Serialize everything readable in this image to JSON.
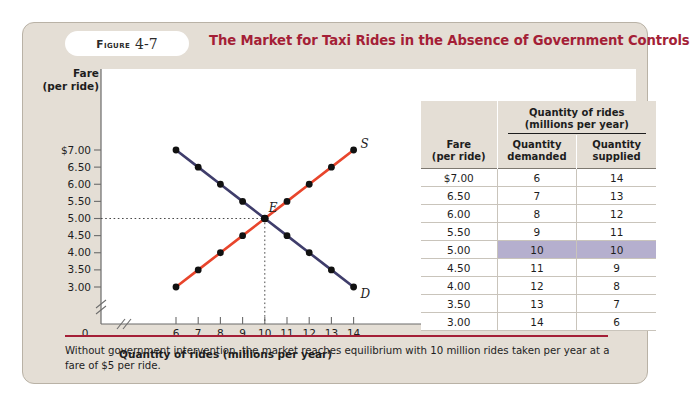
{
  "figure": {
    "label_word": "Figure",
    "number": "4-7",
    "title": "The Market for Taxi Rides in the Absence of Government Controls",
    "caption": "Without government intervention, the market reaches equilibrium with 10 million rides taken per year at a fare of $5 per ride.",
    "accent_color": "#a41f37",
    "card_background": "#e4ded5",
    "highlight_color": "#b5afce"
  },
  "chart_data": {
    "type": "line",
    "title": "The Market for Taxi Rides in the Absence of Government Controls",
    "xlabel": "Quantity of rides (millions per year)",
    "ylabel": "Fare (per ride)",
    "ylabel_line1": "Fare",
    "ylabel_line2": "(per ride)",
    "xlim": [
      6,
      14
    ],
    "ylim": [
      3.0,
      7.0
    ],
    "x_ticks": [
      "6",
      "7",
      "8",
      "9",
      "10",
      "11",
      "12",
      "13",
      "14"
    ],
    "x_origin_label": "0",
    "y_ticks": [
      "$7.00",
      "6.50",
      "6.00",
      "5.50",
      "5.00",
      "4.50",
      "4.00",
      "3.50",
      "3.00"
    ],
    "axis_break": true,
    "grid": false,
    "series": [
      {
        "name": "Demand",
        "label": "D",
        "color": "#3f3d6b",
        "x": [
          6,
          7,
          8,
          9,
          10,
          11,
          12,
          13,
          14
        ],
        "values": [
          7.0,
          6.5,
          6.0,
          5.5,
          5.0,
          4.5,
          4.0,
          3.5,
          3.0
        ]
      },
      {
        "name": "Supply",
        "label": "S",
        "color": "#e8452c",
        "x": [
          6,
          7,
          8,
          9,
          10,
          11,
          12,
          13,
          14
        ],
        "values": [
          3.0,
          3.5,
          4.0,
          4.5,
          5.0,
          5.5,
          6.0,
          6.5,
          7.0
        ]
      }
    ],
    "annotations": [
      {
        "name": "equilibrium",
        "label": "E",
        "x": 10,
        "y": 5.0,
        "guides": "dotted"
      }
    ]
  },
  "table": {
    "header_fare_line1": "Fare",
    "header_fare_line2": "(per ride)",
    "header_group_line1": "Quantity of rides",
    "header_group_line2": "(millions per year)",
    "header_demanded_line1": "Quantity",
    "header_demanded_line2": "demanded",
    "header_supplied_line1": "Quantity",
    "header_supplied_line2": "supplied",
    "rows": [
      {
        "fare": "$7.00",
        "demanded": "6",
        "supplied": "14",
        "highlight": false
      },
      {
        "fare": "6.50",
        "demanded": "7",
        "supplied": "13",
        "highlight": false
      },
      {
        "fare": "6.00",
        "demanded": "8",
        "supplied": "12",
        "highlight": false
      },
      {
        "fare": "5.50",
        "demanded": "9",
        "supplied": "11",
        "highlight": false
      },
      {
        "fare": "5.00",
        "demanded": "10",
        "supplied": "10",
        "highlight": true
      },
      {
        "fare": "4.50",
        "demanded": "11",
        "supplied": "9",
        "highlight": false
      },
      {
        "fare": "4.00",
        "demanded": "12",
        "supplied": "8",
        "highlight": false
      },
      {
        "fare": "3.50",
        "demanded": "13",
        "supplied": "7",
        "highlight": false
      },
      {
        "fare": "3.00",
        "demanded": "14",
        "supplied": "6",
        "highlight": false
      }
    ]
  }
}
